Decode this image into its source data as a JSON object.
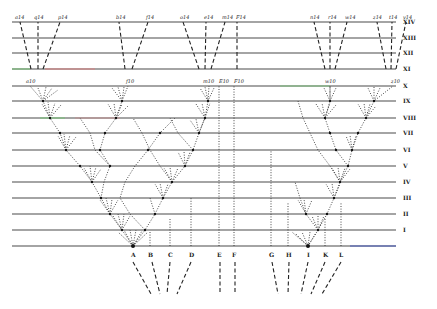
{
  "colors": {
    "line": "#4a4a4a",
    "ink": "#222222",
    "accent_green": "#7fbf7f",
    "accent_red": "#d98080",
    "accent_blue": "#4a5fc0"
  },
  "generations": [
    {
      "label": "XIV",
      "y": 22
    },
    {
      "label": "XIII",
      "y": 38
    },
    {
      "label": "XII",
      "y": 53
    },
    {
      "label": "XI",
      "y": 69
    },
    {
      "label": "X",
      "y": 86
    },
    {
      "label": "IX",
      "y": 101
    },
    {
      "label": "VIII",
      "y": 118
    },
    {
      "label": "VII",
      "y": 133
    },
    {
      "label": "VI",
      "y": 150
    },
    {
      "label": "V",
      "y": 166
    },
    {
      "label": "IV",
      "y": 182
    },
    {
      "label": "III",
      "y": 198
    },
    {
      "label": "II",
      "y": 214
    },
    {
      "label": "I",
      "y": 230
    },
    {
      "label": "",
      "y": 246
    }
  ],
  "species": [
    {
      "label": "A",
      "x": 133
    },
    {
      "label": "B",
      "x": 150
    },
    {
      "label": "C",
      "x": 170
    },
    {
      "label": "D",
      "x": 191
    },
    {
      "label": "E",
      "x": 219
    },
    {
      "label": "F",
      "x": 234
    },
    {
      "label": "G",
      "x": 271
    },
    {
      "label": "H",
      "x": 288
    },
    {
      "label": "I",
      "x": 308
    },
    {
      "label": "K",
      "x": 325
    },
    {
      "label": "L",
      "x": 341
    }
  ],
  "top_labels": [
    {
      "label": "a14",
      "x": 20
    },
    {
      "label": "q14",
      "x": 37
    },
    {
      "label": "p14",
      "x": 61
    },
    {
      "label": "b14",
      "x": 119
    },
    {
      "label": "f14",
      "x": 149
    },
    {
      "label": "o14",
      "x": 182
    },
    {
      "label": "e14",
      "x": 207
    },
    {
      "label": "m14",
      "x": 225
    },
    {
      "label": "F14",
      "x": 237
    },
    {
      "label": "n14",
      "x": 313
    },
    {
      "label": "r14",
      "x": 330
    },
    {
      "label": "w14",
      "x": 346
    },
    {
      "label": "z14",
      "x": 375
    },
    {
      "label": "t14",
      "x": 391
    },
    {
      "label": "v14",
      "x": 410
    }
  ],
  "gen10_labels": [
    {
      "label": "a10",
      "x": 30
    },
    {
      "label": "f10",
      "x": 130
    },
    {
      "label": "m10",
      "x": 208
    },
    {
      "label": "E10",
      "x": 221
    },
    {
      "label": "F10",
      "x": 235
    },
    {
      "label": "w10",
      "x": 330
    },
    {
      "label": "z10",
      "x": 396
    }
  ]
}
